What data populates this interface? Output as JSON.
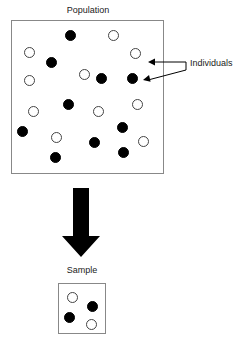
{
  "diagram": {
    "type": "sampling-diagram",
    "population": {
      "label": "Population",
      "box": {
        "x": 11,
        "y": 20,
        "width": 153,
        "height": 154
      },
      "dot_diameter": 11,
      "counts": {
        "filled": 12,
        "open": 11,
        "total": 23
      },
      "individuals": [
        {
          "x": 70,
          "y": 35,
          "fill": "filled"
        },
        {
          "x": 113,
          "y": 35,
          "fill": "open"
        },
        {
          "x": 29,
          "y": 52,
          "fill": "open"
        },
        {
          "x": 135,
          "y": 53,
          "fill": "open"
        },
        {
          "x": 51,
          "y": 62,
          "fill": "filled"
        },
        {
          "x": 84,
          "y": 74,
          "fill": "open"
        },
        {
          "x": 101,
          "y": 78,
          "fill": "filled"
        },
        {
          "x": 132,
          "y": 78,
          "fill": "filled"
        },
        {
          "x": 29,
          "y": 80,
          "fill": "open"
        },
        {
          "x": 68,
          "y": 104,
          "fill": "filled"
        },
        {
          "x": 137,
          "y": 104,
          "fill": "open"
        },
        {
          "x": 33,
          "y": 111,
          "fill": "open"
        },
        {
          "x": 98,
          "y": 111,
          "fill": "open"
        },
        {
          "x": 22,
          "y": 131,
          "fill": "filled"
        },
        {
          "x": 56,
          "y": 137,
          "fill": "open"
        },
        {
          "x": 122,
          "y": 127,
          "fill": "filled"
        },
        {
          "x": 94,
          "y": 142,
          "fill": "filled"
        },
        {
          "x": 143,
          "y": 141,
          "fill": "open"
        },
        {
          "x": 123,
          "y": 152,
          "fill": "filled"
        },
        {
          "x": 55,
          "y": 157,
          "fill": "filled"
        }
      ]
    },
    "annotation": {
      "label": "Individuals",
      "arrows": [
        {
          "from_x": 186,
          "from_y": 62,
          "to_x": 148,
          "to_y": 62
        },
        {
          "from_x": 186,
          "from_y": 70,
          "to_x": 143,
          "to_y": 80
        }
      ],
      "leader_x": 186,
      "leader_y1": 62,
      "leader_y2": 70
    },
    "flow_arrow": {
      "label": "sampling",
      "shaft_x": 73,
      "shaft_width": 16,
      "top_y": 188,
      "head_top_y": 236,
      "tip_y": 257,
      "head_left_x": 62,
      "head_right_x": 100,
      "color": "#000000"
    },
    "sample": {
      "label": "Sample",
      "box": {
        "x": 58,
        "y": 283,
        "width": 48,
        "height": 51
      },
      "dot_diameter": 11,
      "counts": {
        "filled": 2,
        "open": 2,
        "total": 4
      },
      "individuals": [
        {
          "x": 72,
          "y": 297,
          "fill": "open"
        },
        {
          "x": 92,
          "y": 306,
          "fill": "filled"
        },
        {
          "x": 69,
          "y": 317,
          "fill": "filled"
        },
        {
          "x": 91,
          "y": 324,
          "fill": "open"
        }
      ]
    },
    "colors": {
      "filled_dot": "#000000",
      "open_dot_stroke": "#444444",
      "box_stroke": "#888888",
      "text": "#1a1a1a",
      "arrow": "#000000",
      "background": "#ffffff"
    }
  }
}
